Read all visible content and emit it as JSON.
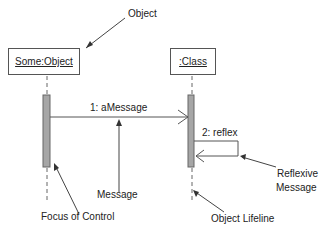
{
  "diagram": {
    "type": "UML sequence diagram",
    "objects": [
      {
        "id": "some-object",
        "label": "Some:Object"
      },
      {
        "id": "class",
        "label": ":Class"
      }
    ],
    "messages": [
      {
        "label": "1: aMessage",
        "from": "Some:Object",
        "to": ":Class"
      },
      {
        "label": "2: reflex",
        "from": ":Class",
        "to": ":Class"
      }
    ],
    "annotations": {
      "object": "Object",
      "message": "Message",
      "focus_of_control": "Focus of Control",
      "reflexive_message_line1": "Reflexive",
      "reflexive_message_line2": "Message",
      "object_lifeline": "Object Lifeline"
    },
    "colors": {
      "line": "#555555",
      "activation_fill": "#a6a6a6",
      "text": "#222222"
    }
  }
}
